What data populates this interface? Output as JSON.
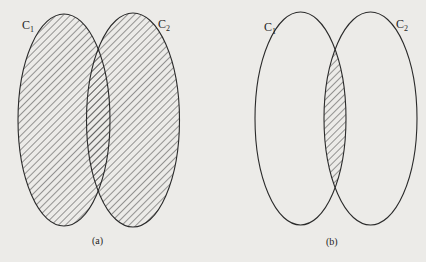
{
  "figure": {
    "panels": [
      {
        "id": "a",
        "caption": "(a)",
        "description": "Union of C1 and C2 shaded",
        "shaded_region": "union",
        "sets": [
          {
            "name": "C",
            "subscript": "1",
            "cx": 64,
            "cy": 120,
            "rx": 46,
            "ry": 106
          },
          {
            "name": "C",
            "subscript": "2",
            "cx": 133,
            "cy": 120,
            "rx": 46.5,
            "ry": 107
          }
        ]
      },
      {
        "id": "b",
        "caption": "(b)",
        "description": "Intersection of C1 and C2 shaded",
        "shaded_region": "intersection",
        "sets": [
          {
            "name": "C",
            "subscript": "1",
            "cx": 300.5,
            "cy": 118.5,
            "rx": 45.5,
            "ry": 106.5
          },
          {
            "name": "C",
            "subscript": "2",
            "cx": 370.5,
            "cy": 118.5,
            "rx": 46.5,
            "ry": 106.5
          }
        ]
      }
    ],
    "colors": {
      "background": "#ecebe8",
      "stroke": "#2a2a2a",
      "hatch": "#3a3a3a"
    }
  }
}
